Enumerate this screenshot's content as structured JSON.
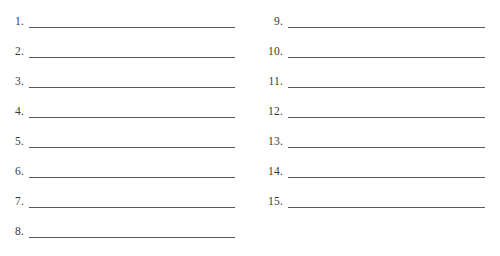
{
  "document": {
    "type": "numbered-blank-line-worksheet",
    "background_color": "#ffffff",
    "rule_color": "#58585a",
    "number_color": "#3a3a3a",
    "columns": [
      {
        "name": "left-column",
        "entries": [
          {
            "number": "1.",
            "value": ""
          },
          {
            "number": "2.",
            "value": ""
          },
          {
            "number": "3.",
            "value": ""
          },
          {
            "number": "4.",
            "value": ""
          },
          {
            "number": "5.",
            "value": ""
          },
          {
            "number": "6.",
            "value": ""
          },
          {
            "number": "7.",
            "value": ""
          },
          {
            "number": "8.",
            "value": ""
          }
        ]
      },
      {
        "name": "right-column",
        "entries": [
          {
            "number": "9.",
            "value": ""
          },
          {
            "number": "10.",
            "value": ""
          },
          {
            "number": "11.",
            "value": ""
          },
          {
            "number": "12.",
            "value": ""
          },
          {
            "number": "13.",
            "value": ""
          },
          {
            "number": "14.",
            "value": ""
          },
          {
            "number": "15.",
            "value": ""
          }
        ]
      }
    ]
  }
}
